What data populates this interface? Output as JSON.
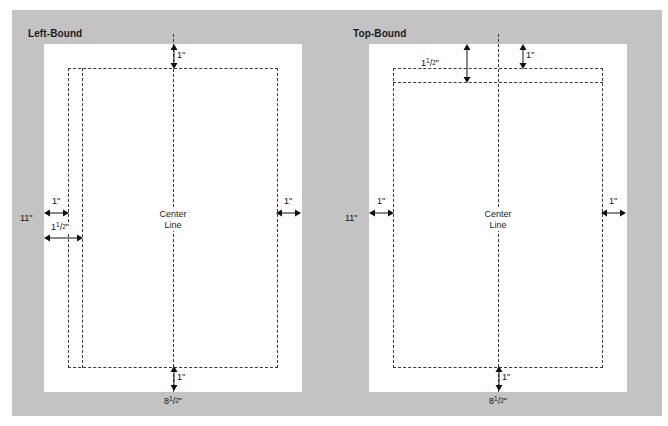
{
  "figure": {
    "background_color": "#ffffff",
    "plate_color": "#c3c3c3",
    "sheet_color": "#ffffff",
    "guide_color": "#3a3a3a"
  },
  "panels": [
    {
      "id": "left-bound",
      "title": "Left-Bound",
      "center_line_label_line1": "Center",
      "center_line_label_line2": "Line",
      "top_margin": "1\"",
      "bottom_margin": "1\"",
      "left_margin": "1\"",
      "right_margin": "1\"",
      "gutter_label_whole": "1",
      "gutter_label_num": "1",
      "gutter_label_den": "2",
      "gutter_label_unit": "\"",
      "height_label": "11\"",
      "width_label_whole": "8",
      "width_label_num": "1",
      "width_label_den": "2",
      "width_label_unit": "\""
    },
    {
      "id": "top-bound",
      "title": "Top-Bound",
      "center_line_label_line1": "Center",
      "center_line_label_line2": "Line",
      "top_margin": "1\"",
      "bottom_margin": "1\"",
      "left_margin": "1\"",
      "right_margin": "1\"",
      "gutter_label_whole": "1",
      "gutter_label_num": "1",
      "gutter_label_den": "2",
      "gutter_label_unit": "\"",
      "height_label": "11\"",
      "width_label_whole": "8",
      "width_label_num": "1",
      "width_label_den": "2",
      "width_label_unit": "\""
    }
  ]
}
